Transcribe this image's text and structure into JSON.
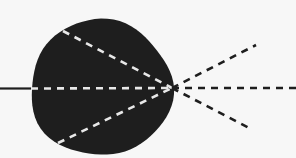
{
  "diagram": {
    "type": "lens-ray-divergence",
    "background": "#f7f7f7",
    "body": {
      "shape": "ellipse",
      "cx": 101,
      "cy": 88,
      "rx": 71,
      "ry": 68,
      "fill": "#1e1e1e"
    },
    "incoming_line": {
      "style": "solid",
      "color": "#1e1e1e",
      "x1": 0,
      "y1": 88.5,
      "x2": 31,
      "y2": 88.5
    },
    "focal_point": {
      "x": 172,
      "y": 88
    },
    "internal_rays": [
      {
        "name": "upper",
        "style": "dashed",
        "color": "#e8e8e8",
        "x1": 63,
        "y1": 31,
        "x2": 172,
        "y2": 88
      },
      {
        "name": "middle",
        "style": "dashed",
        "color": "#e8e8e8",
        "x1": 31,
        "y1": 88.5,
        "x2": 172,
        "y2": 88
      },
      {
        "name": "lower",
        "style": "dashed",
        "color": "#e8e8e8",
        "x1": 58,
        "y1": 143,
        "x2": 172,
        "y2": 88
      }
    ],
    "external_rays": [
      {
        "name": "upper",
        "style": "dashed",
        "color": "#1e1e1e",
        "x1": 172,
        "y1": 88,
        "x2": 256,
        "y2": 45
      },
      {
        "name": "middle",
        "style": "dashed",
        "color": "#1e1e1e",
        "x1": 172,
        "y1": 88,
        "x2": 296,
        "y2": 88
      },
      {
        "name": "lower",
        "style": "dashed",
        "color": "#1e1e1e",
        "x1": 172,
        "y1": 88,
        "x2": 251,
        "y2": 129
      }
    ]
  }
}
